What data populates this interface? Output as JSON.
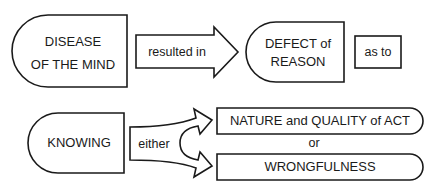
{
  "diagram": {
    "row1": {
      "node_disease": {
        "line1": "DISEASE",
        "line2": "OF THE MIND"
      },
      "arrow_resulted": {
        "label": "resulted in"
      },
      "node_defect": {
        "line1": "DEFECT of",
        "line2": "REASON"
      },
      "node_as_to": {
        "label": "as to"
      }
    },
    "row2": {
      "node_knowing": {
        "label": "KNOWING"
      },
      "arrow_either": {
        "label": "either"
      },
      "option_nature": {
        "label": "NATURE and QUALITY of ACT"
      },
      "connector_or": {
        "label": "or"
      },
      "option_wrongfulness": {
        "label": "WRONGFULNESS"
      }
    },
    "colors": {
      "stroke": "#1a1a1a",
      "fill": "#ffffff"
    }
  }
}
